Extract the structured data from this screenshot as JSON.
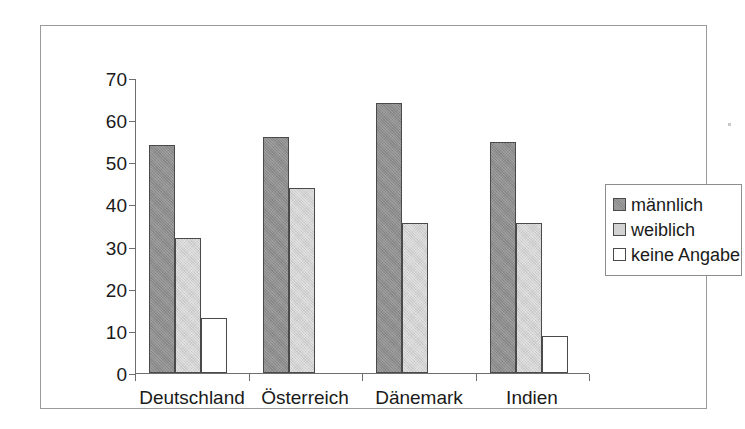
{
  "chart_data": {
    "type": "bar",
    "title": "",
    "xlabel": "",
    "ylabel": "",
    "ylim": [
      0,
      70
    ],
    "yticks": [
      0,
      10,
      20,
      30,
      40,
      50,
      60,
      70
    ],
    "grid": false,
    "legend_position": "right",
    "categories": [
      "Deutschland",
      "Österreich",
      "Dänemark",
      "Indien"
    ],
    "series": [
      {
        "name": "männlich",
        "color": "#8d8d8d",
        "values": [
          54,
          56,
          64,
          54.7
        ]
      },
      {
        "name": "weiblich",
        "color": "#d2d2d2",
        "values": [
          32,
          44,
          35.7,
          35.7
        ]
      },
      {
        "name": "keine Angabe",
        "color": "#ffffff",
        "values": [
          13,
          null,
          null,
          8.7
        ]
      }
    ]
  },
  "legend": {
    "items": [
      {
        "label": "männlich"
      },
      {
        "label": "weiblich"
      },
      {
        "label": "keine Angabe"
      }
    ]
  },
  "axis": {
    "y_labels": [
      "70",
      "60",
      "50",
      "40",
      "30",
      "20",
      "10",
      "0"
    ],
    "x_labels": [
      "Deutschland",
      "Österreich",
      "Dänemark",
      "Indien"
    ]
  }
}
